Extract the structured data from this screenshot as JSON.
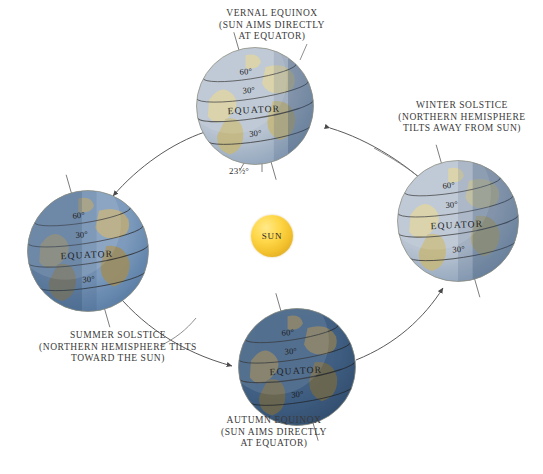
{
  "diagram": {
    "background_color": "#ffffff",
    "sun": {
      "label": "SUN",
      "color": "#ffd84a",
      "cx": 272,
      "cy": 236,
      "r": 21
    },
    "orbit": {
      "direction": "counterclockwise",
      "center": [
        272,
        236
      ],
      "rx": 188,
      "ry": 130,
      "stroke_color": "#555555"
    },
    "tilt_annotation": {
      "value": "23½°",
      "x": 229,
      "y": 166
    },
    "latitude_labels": [
      "60°",
      "30°",
      "EQUATOR",
      "30°"
    ],
    "positions": [
      {
        "id": "vernal-equinox",
        "label": "VERNAL EQUINOX\n(SUN AIMS DIRECTLY\nAT EQUATOR)",
        "label_x": 182,
        "label_y": 8,
        "label_w": 180,
        "globe_x": 196,
        "globe_y": 47,
        "globe_size": 118,
        "lit_from": "left",
        "terminator": 0.78,
        "tone": "pale",
        "axis_tilt_deg": -16
      },
      {
        "id": "winter-solstice",
        "label": "WINTER SOLSTICE\n(NORTHERN HEMISPHERE\nTILTS AWAY FROM SUN)",
        "label_x": 382,
        "label_y": 100,
        "label_w": 160,
        "globe_x": 397,
        "globe_y": 160,
        "globe_size": 122,
        "lit_from": "left",
        "terminator": 0.62,
        "tone": "pale",
        "axis_tilt_deg": -16
      },
      {
        "id": "autumn-equinox",
        "label": "AUTUMN EQUINOX\n(SUN AIMS DIRECTLY\nAT EQUATOR)",
        "label_x": 184,
        "label_y": 415,
        "label_w": 180,
        "globe_x": 238,
        "globe_y": 308,
        "globe_size": 118,
        "lit_from": "top",
        "terminator": 0.95,
        "tone": "deep",
        "axis_tilt_deg": -16
      },
      {
        "id": "summer-solstice",
        "label": "SUMMER SOLSTICE\n(NORTHERN HEMISPHERE TILTS\nTOWARD THE SUN)",
        "label_x": 20,
        "label_y": 330,
        "label_w": 196,
        "globe_x": 27,
        "globe_y": 190,
        "globe_size": 122,
        "lit_from": "right",
        "terminator": 0.45,
        "tone": "mid",
        "axis_tilt_deg": -16
      }
    ]
  }
}
